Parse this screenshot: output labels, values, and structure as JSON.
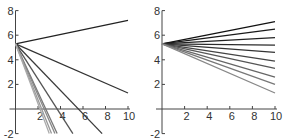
{
  "chart_data": [
    {
      "type": "line",
      "title": "",
      "xlabel": "",
      "ylabel": "",
      "xlim": [
        0,
        10
      ],
      "ylim": [
        -2,
        8
      ],
      "x_ticks": [
        "2",
        "4",
        "6",
        "8",
        "10"
      ],
      "y_ticks": [
        "-2",
        "2",
        "4",
        "6",
        "8"
      ],
      "grid": false,
      "legend": null,
      "origin": [
        0,
        5.3
      ],
      "series": [
        {
          "name": "line1",
          "x": [
            0,
            10
          ],
          "y": [
            5.3,
            7.2
          ],
          "shade": "#222222"
        },
        {
          "name": "line2",
          "x": [
            0,
            10
          ],
          "y": [
            5.3,
            1.3
          ],
          "shade": "#333333"
        },
        {
          "name": "line3",
          "x": [
            0,
            7.7
          ],
          "y": [
            5.3,
            -2
          ],
          "shade": "#3a3a3a"
        },
        {
          "name": "line4",
          "x": [
            0,
            5.1
          ],
          "y": [
            5.3,
            -2
          ],
          "shade": "#555555"
        },
        {
          "name": "line5",
          "x": [
            0,
            3.7
          ],
          "y": [
            5.3,
            -2
          ],
          "shade": "#777777"
        },
        {
          "name": "line6",
          "x": [
            0,
            3.5
          ],
          "y": [
            5.3,
            -2
          ],
          "shade": "#888888"
        },
        {
          "name": "line7",
          "x": [
            0,
            3.2
          ],
          "y": [
            5.3,
            -2
          ],
          "shade": "#999999"
        },
        {
          "name": "line8",
          "x": [
            0,
            3.0
          ],
          "y": [
            5.3,
            -2
          ],
          "shade": "#aaaaaa"
        }
      ]
    },
    {
      "type": "line",
      "title": "",
      "xlabel": "",
      "ylabel": "",
      "xlim": [
        0,
        10
      ],
      "ylim": [
        -2,
        8
      ],
      "x_ticks": [
        "2",
        "4",
        "6",
        "8",
        "10"
      ],
      "y_ticks": [
        "-2",
        "2",
        "4",
        "6",
        "8"
      ],
      "grid": false,
      "legend": null,
      "origin": [
        0,
        5.3
      ],
      "series": [
        {
          "name": "line1",
          "x": [
            0,
            10
          ],
          "y": [
            5.3,
            7.1
          ],
          "shade": "#111111"
        },
        {
          "name": "line2",
          "x": [
            0,
            10
          ],
          "y": [
            5.3,
            6.5
          ],
          "shade": "#1a1a1a"
        },
        {
          "name": "line3",
          "x": [
            0,
            10
          ],
          "y": [
            5.3,
            5.8
          ],
          "shade": "#222222"
        },
        {
          "name": "line4",
          "x": [
            0,
            10
          ],
          "y": [
            5.3,
            5.2
          ],
          "shade": "#2b2b2b"
        },
        {
          "name": "line5",
          "x": [
            0,
            10
          ],
          "y": [
            5.3,
            4.6
          ],
          "shade": "#333333"
        },
        {
          "name": "line6",
          "x": [
            0,
            10
          ],
          "y": [
            5.3,
            3.9
          ],
          "shade": "#444444"
        },
        {
          "name": "line7",
          "x": [
            0,
            10
          ],
          "y": [
            5.3,
            3.3
          ],
          "shade": "#555555"
        },
        {
          "name": "line8",
          "x": [
            0,
            10
          ],
          "y": [
            5.3,
            2.6
          ],
          "shade": "#666666"
        },
        {
          "name": "line9",
          "x": [
            0,
            10
          ],
          "y": [
            5.3,
            2.0
          ],
          "shade": "#777777"
        },
        {
          "name": "line10",
          "x": [
            0,
            10
          ],
          "y": [
            5.3,
            1.3
          ],
          "shade": "#888888"
        }
      ]
    }
  ]
}
